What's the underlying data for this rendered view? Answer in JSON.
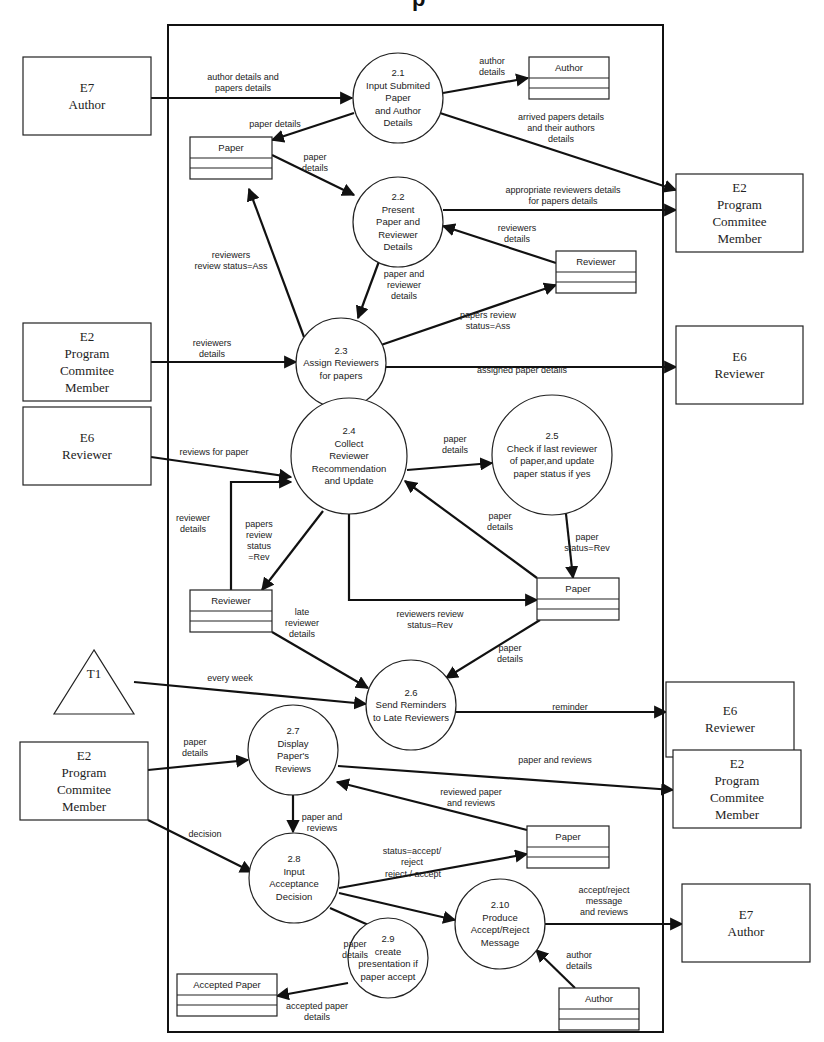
{
  "title_fragment": "p",
  "processes": [
    {
      "id": "p2_1",
      "number": "2.1",
      "lines": [
        "Input Submited",
        "Paper",
        "and Author",
        "Details"
      ]
    },
    {
      "id": "p2_2",
      "number": "2.2",
      "lines": [
        "Present",
        "Paper and",
        "Reviewer",
        "Details"
      ]
    },
    {
      "id": "p2_3",
      "number": "2.3",
      "lines": [
        "Assign Reviewers",
        "for papers"
      ]
    },
    {
      "id": "p2_4",
      "number": "2.4",
      "lines": [
        "Collect",
        "Reviewer",
        "Recommendation",
        "and Update"
      ]
    },
    {
      "id": "p2_5",
      "number": "2.5",
      "lines": [
        "Check if last reviewer",
        "of paper,and update",
        "paper status if yes"
      ]
    },
    {
      "id": "p2_6",
      "number": "2.6",
      "lines": [
        "Send Reminders",
        "to Late Reviewers"
      ]
    },
    {
      "id": "p2_7",
      "number": "2.7",
      "lines": [
        "Display",
        "Paper's",
        "Reviews"
      ]
    },
    {
      "id": "p2_8",
      "number": "2.8",
      "lines": [
        "Input",
        "Acceptance",
        "Decision"
      ]
    },
    {
      "id": "p2_9",
      "number": "2.9",
      "lines": [
        "create",
        "presentation if",
        "paper accept"
      ]
    },
    {
      "id": "p2_10",
      "number": "2.10",
      "lines": [
        "Produce",
        "Accept/Reject",
        "Message"
      ]
    }
  ],
  "entities": [
    {
      "id": "e7_top",
      "code": "E7",
      "lines": [
        "Author"
      ]
    },
    {
      "id": "e2_right_top",
      "code": "E2",
      "lines": [
        "Program",
        "Commitee",
        "Member"
      ]
    },
    {
      "id": "e2_left_mid",
      "code": "E2",
      "lines": [
        "Program",
        "Commitee",
        "Member"
      ]
    },
    {
      "id": "e6_right_top",
      "code": "E6",
      "lines": [
        "Reviewer"
      ]
    },
    {
      "id": "e6_left",
      "code": "E6",
      "lines": [
        "Reviewer"
      ]
    },
    {
      "id": "e6_right_mid",
      "code": "E6",
      "lines": [
        "Reviewer"
      ]
    },
    {
      "id": "e2_left_bottom",
      "code": "E2",
      "lines": [
        "Program",
        "Commitee",
        "Member"
      ]
    },
    {
      "id": "e2_right_bottom",
      "code": "E2",
      "lines": [
        "Program",
        "Commitee",
        "Member"
      ]
    },
    {
      "id": "e7_bottom",
      "code": "E7",
      "lines": [
        "Author"
      ]
    }
  ],
  "timer": {
    "label": "T1"
  },
  "stores": [
    {
      "id": "author_top",
      "label": "Author"
    },
    {
      "id": "paper_top",
      "label": "Paper"
    },
    {
      "id": "reviewer_top",
      "label": "Reviewer"
    },
    {
      "id": "reviewer_mid",
      "label": "Reviewer"
    },
    {
      "id": "paper_mid",
      "label": "Paper"
    },
    {
      "id": "paper_bottom",
      "label": "Paper"
    },
    {
      "id": "accepted_paper",
      "label": "Accepted Paper"
    },
    {
      "id": "author_bottom",
      "label": "Author"
    }
  ],
  "flows": [
    {
      "id": "f1",
      "lines": [
        "author details and",
        "papers details"
      ]
    },
    {
      "id": "f2",
      "lines": [
        "author",
        "details"
      ]
    },
    {
      "id": "f3",
      "lines": [
        "paper details"
      ]
    },
    {
      "id": "f4",
      "lines": [
        "arrived papers details",
        "and their authors",
        "details"
      ]
    },
    {
      "id": "f5",
      "lines": [
        "paper",
        "details"
      ]
    },
    {
      "id": "f6",
      "lines": [
        "appropriate reviewers details",
        "for papers details"
      ]
    },
    {
      "id": "f7",
      "lines": [
        "reviewers",
        "details"
      ]
    },
    {
      "id": "f8",
      "lines": [
        "reviewers",
        "review status=Ass"
      ]
    },
    {
      "id": "f9",
      "lines": [
        "paper and",
        "reviewer",
        "details"
      ]
    },
    {
      "id": "f10",
      "lines": [
        "papers review",
        "status=Ass"
      ]
    },
    {
      "id": "f11",
      "lines": [
        "reviewers",
        "details"
      ]
    },
    {
      "id": "f12",
      "lines": [
        "assigned paper details"
      ]
    },
    {
      "id": "f13",
      "lines": [
        "reviews for paper"
      ]
    },
    {
      "id": "f14",
      "lines": [
        "paper",
        "details"
      ]
    },
    {
      "id": "f15",
      "lines": [
        "reviewer",
        "details"
      ]
    },
    {
      "id": "f16",
      "lines": [
        "papers",
        "review",
        "status",
        "=Rev"
      ]
    },
    {
      "id": "f17",
      "lines": [
        "paper",
        "details"
      ]
    },
    {
      "id": "f18",
      "lines": [
        "paper",
        "status=Rev"
      ]
    },
    {
      "id": "f19",
      "lines": [
        "reviewers  review",
        "status=Rev"
      ]
    },
    {
      "id": "f20",
      "lines": [
        "late",
        "reviewer",
        "details"
      ]
    },
    {
      "id": "f21",
      "lines": [
        "paper",
        "details"
      ]
    },
    {
      "id": "f22",
      "lines": [
        "every week"
      ]
    },
    {
      "id": "f23",
      "lines": [
        "reminder"
      ]
    },
    {
      "id": "f24",
      "lines": [
        "paper",
        "details"
      ]
    },
    {
      "id": "f25",
      "lines": [
        "paper and reviews"
      ]
    },
    {
      "id": "f26",
      "lines": [
        "reviewed paper",
        "and reviews"
      ]
    },
    {
      "id": "f27",
      "lines": [
        "paper and",
        "reviews"
      ]
    },
    {
      "id": "f28",
      "lines": [
        "decision"
      ]
    },
    {
      "id": "f29",
      "lines": [
        "status=accept/",
        "reject"
      ]
    },
    {
      "id": "f30",
      "lines": [
        "reject / accept"
      ]
    },
    {
      "id": "f31",
      "lines": [
        "accept/reject",
        "message",
        "and reviews"
      ]
    },
    {
      "id": "f32",
      "lines": [
        "author",
        "details"
      ]
    },
    {
      "id": "f33",
      "lines": [
        "paper",
        "details"
      ]
    },
    {
      "id": "f34",
      "lines": [
        "accepted paper",
        "details"
      ]
    }
  ]
}
